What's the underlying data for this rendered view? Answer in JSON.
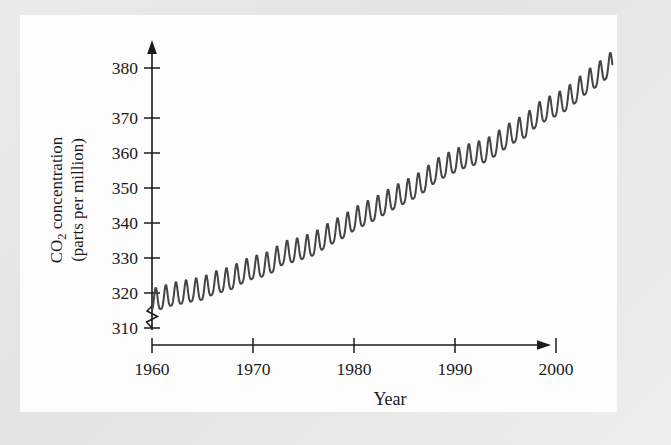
{
  "figure": {
    "background_color": "#e8e8e8",
    "panel_color": "#fdfdfd",
    "line_color": "#454545",
    "axis_color": "#1a1a1a"
  },
  "axes": {
    "y_title_line1_pre": "CO",
    "y_title_line1_sub": "2",
    "y_title_line1_post": " concentration",
    "y_title_line2": "(parts per million)",
    "x_title": "Year",
    "y_ticks": [
      "310",
      "320",
      "330",
      "340",
      "350",
      "360",
      "370",
      "380"
    ],
    "x_ticks": [
      "1960",
      "1970",
      "1980",
      "1990",
      "2000"
    ],
    "axis_break_marker": "axis-break-zigzag"
  },
  "chart_data": {
    "type": "line",
    "title": "",
    "subtitle": "",
    "xlabel": "Year",
    "ylabel": "CO2 concentration (parts per million)",
    "xlim": [
      1960,
      2006
    ],
    "ylim": [
      310,
      382
    ],
    "y_axis_break_below": 310,
    "grid": false,
    "legend": null,
    "annotations": [],
    "series": [
      {
        "name": "Atmospheric CO2 (monthly mean)",
        "color": "#454545",
        "annual_cycle_amplitude_ppm": 3.1,
        "x": [
          1960,
          1961,
          1962,
          1963,
          1964,
          1965,
          1966,
          1967,
          1968,
          1969,
          1970,
          1971,
          1972,
          1973,
          1974,
          1975,
          1976,
          1977,
          1978,
          1979,
          1980,
          1981,
          1982,
          1983,
          1984,
          1985,
          1986,
          1987,
          1988,
          1989,
          1990,
          1991,
          1992,
          1993,
          1994,
          1995,
          1996,
          1997,
          1998,
          1999,
          2000,
          2001,
          2002,
          2003,
          2004,
          2005
        ],
        "values": [
          316.9,
          317.6,
          318.5,
          319.0,
          319.6,
          320.0,
          321.4,
          322.2,
          323.0,
          324.6,
          325.7,
          326.3,
          327.5,
          329.7,
          330.2,
          331.1,
          332.0,
          333.8,
          335.4,
          336.8,
          338.7,
          340.1,
          341.4,
          343.0,
          344.6,
          346.0,
          347.4,
          349.2,
          351.6,
          353.1,
          354.4,
          355.6,
          356.4,
          357.1,
          358.8,
          360.8,
          362.6,
          363.8,
          366.6,
          368.3,
          369.5,
          371.0,
          373.2,
          375.6,
          377.4,
          379.6
        ]
      }
    ]
  }
}
